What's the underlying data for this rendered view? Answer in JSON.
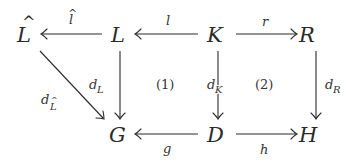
{
  "diagram": {
    "type": "commutative-diagram",
    "nodes": {
      "Lhat": {
        "label": "L",
        "hat": "^"
      },
      "L": {
        "label": "L"
      },
      "K": {
        "label": "K"
      },
      "R": {
        "label": "R"
      },
      "G": {
        "label": "G"
      },
      "D": {
        "label": "D"
      },
      "H": {
        "label": "H"
      }
    },
    "edges": {
      "lhat": {
        "from": "L",
        "to": "L̂",
        "label": "l",
        "hat": "^"
      },
      "l": {
        "from": "K",
        "to": "L",
        "label": "l"
      },
      "r": {
        "from": "K",
        "to": "R",
        "label": "r"
      },
      "dL": {
        "from": "L",
        "to": "G",
        "label": "d",
        "sub": "L"
      },
      "dLhat": {
        "from": "L̂",
        "to": "G",
        "label": "d",
        "sub": "L",
        "sub_hat": "^"
      },
      "dK": {
        "from": "K",
        "to": "D",
        "label": "d",
        "sub": "K"
      },
      "dR": {
        "from": "R",
        "to": "H",
        "label": "d",
        "sub": "R"
      },
      "g": {
        "from": "D",
        "to": "G",
        "label": "g"
      },
      "h": {
        "from": "D",
        "to": "H",
        "label": "h"
      }
    },
    "regions": {
      "one": "(1)",
      "two": "(2)"
    }
  }
}
